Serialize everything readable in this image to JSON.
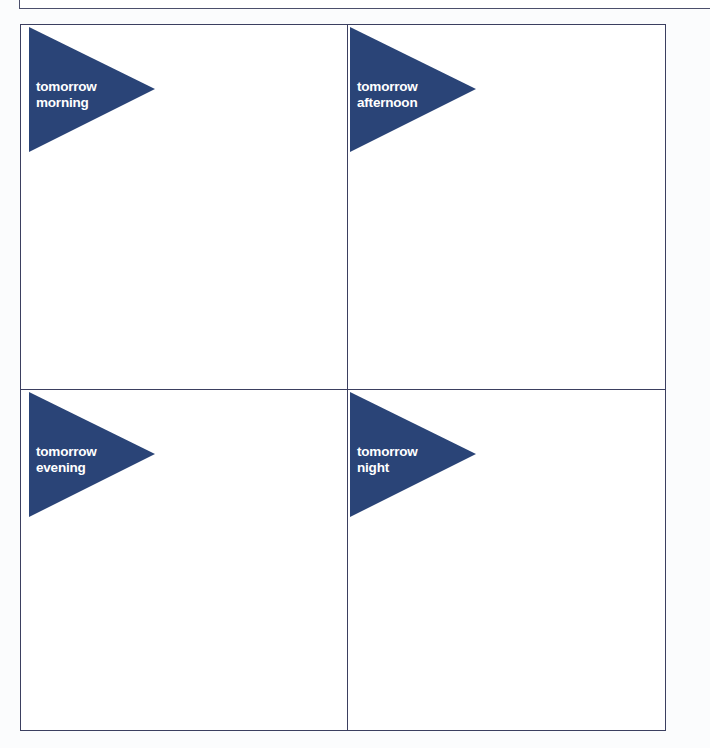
{
  "page": {
    "accent_color": "#2a4477",
    "border_color": "#3b3f60"
  },
  "quadrants": [
    {
      "line1": "tomorrow",
      "line2": "morning"
    },
    {
      "line1": "tomorrow",
      "line2": "afternoon"
    },
    {
      "line1": "tomorrow",
      "line2": "evening"
    },
    {
      "line1": "tomorrow",
      "line2": "night"
    }
  ]
}
